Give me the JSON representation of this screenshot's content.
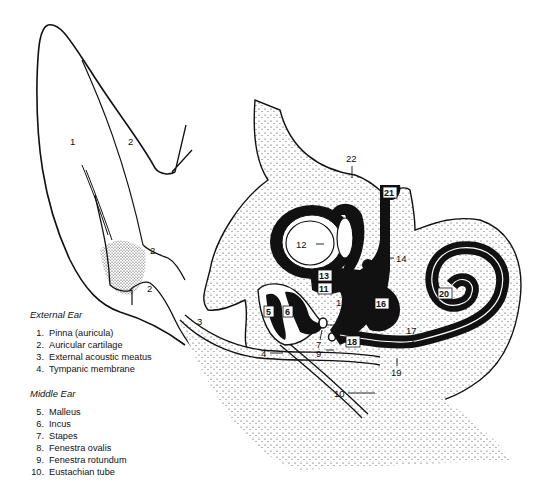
{
  "legend": {
    "external": {
      "heading": "External Ear",
      "items": [
        {
          "num": "1.",
          "label": "Pinna (auricula)"
        },
        {
          "num": "2.",
          "label": "Auricular cartilage"
        },
        {
          "num": "3.",
          "label": "External acoustic meatus"
        },
        {
          "num": "4.",
          "label": "Tympanic membrane"
        }
      ]
    },
    "middle": {
      "heading": "Middle Ear",
      "items": [
        {
          "num": "5.",
          "label": "Malleus"
        },
        {
          "num": "6.",
          "label": "Incus"
        },
        {
          "num": "7.",
          "label": "Stapes"
        },
        {
          "num": "8.",
          "label": "Fenestra ovalis"
        },
        {
          "num": "9.",
          "label": "Fenestra rotundum"
        },
        {
          "num": "10.",
          "label": "Eustachian tube"
        }
      ]
    }
  },
  "labels": {
    "l1": "1",
    "l2a": "2",
    "l2b": "2",
    "l2c": "2",
    "l3": "3",
    "l4": "4",
    "l5": "5",
    "l6": "6",
    "l7": "7",
    "l8": "8",
    "l9": "9",
    "l10": "10",
    "l11": "11",
    "l12": "12",
    "l13": "13",
    "l14": "14",
    "l15": "15",
    "l16": "16",
    "l17": "17",
    "l18": "18",
    "l19": "19",
    "l20": "20",
    "l21": "21",
    "l22": "22"
  },
  "colors": {
    "ink": "#111111",
    "paper": "#ffffff"
  }
}
